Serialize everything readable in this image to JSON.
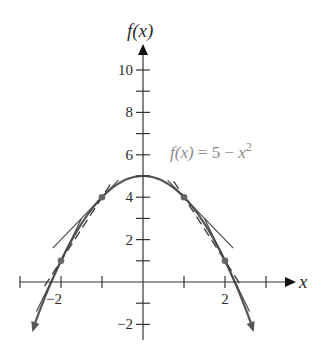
{
  "chart_data": {
    "type": "line",
    "title": "",
    "function_label": "f(x) = 5 − x²",
    "function_label_parts": {
      "lhs": "f(x)",
      "eq": " = 5 − ",
      "var": "x",
      "exp": "2"
    },
    "xlabel": "x",
    "ylabel": "f(x)",
    "xlim": [
      -3.4,
      3.6
    ],
    "ylim": [
      -2.8,
      11.4
    ],
    "grid": false,
    "x_ticks": [
      -3,
      -2,
      -1,
      0,
      1,
      2,
      3
    ],
    "x_tick_labels": [
      {
        "value": -2,
        "label": "−2"
      },
      {
        "value": 2,
        "label": "2"
      }
    ],
    "y_ticks": [
      -2,
      -1,
      1,
      2,
      3,
      4,
      5,
      6,
      7,
      8,
      9,
      10
    ],
    "y_tick_labels": [
      {
        "value": 10,
        "label": "10"
      },
      {
        "value": 8,
        "label": "8"
      },
      {
        "value": 6,
        "label": "6"
      },
      {
        "value": 4,
        "label": "4"
      },
      {
        "value": 2,
        "label": "2"
      },
      {
        "value": -2,
        "label": "−2"
      }
    ],
    "series": [
      {
        "name": "f(x) = 5 − x²",
        "style": "solid-curve",
        "x": [
          -2.65,
          -2.5,
          -2,
          -1.5,
          -1,
          -0.5,
          0,
          0.5,
          1,
          1.5,
          2,
          2.5,
          2.65
        ],
        "y": [
          -2.02,
          -1.25,
          1,
          2.75,
          4,
          4.75,
          5,
          4.75,
          4,
          2.75,
          1,
          -1.25,
          -2.02
        ]
      },
      {
        "name": "tangent at x=1",
        "style": "solid",
        "equation": "y = 6 − 2x",
        "x": [
          0.6,
          2.2
        ],
        "y": [
          4.8,
          1.6
        ]
      },
      {
        "name": "tangent at x=-1",
        "style": "solid",
        "equation": "y = 6 + 2x",
        "x": [
          -2.2,
          -0.6
        ],
        "y": [
          1.6,
          4.8
        ]
      },
      {
        "name": "secant x=1 to x=2",
        "style": "dashed",
        "equation": "y = 7 − 3x",
        "x": [
          0.75,
          2.4
        ],
        "y": [
          4.75,
          -0.2
        ]
      },
      {
        "name": "secant x=-2 to x=-1",
        "style": "dashed",
        "equation": "y = 7 + 3x",
        "x": [
          -2.4,
          -0.75
        ],
        "y": [
          -0.2,
          4.75
        ]
      },
      {
        "name": "tangent at x=2",
        "style": "solid",
        "equation": "y = 9 − 4x",
        "x": [
          1.5,
          2.6
        ],
        "y": [
          3,
          -1.4
        ]
      },
      {
        "name": "tangent at x=-2",
        "style": "solid",
        "equation": "y = 9 + 4x",
        "x": [
          -2.6,
          -1.5
        ],
        "y": [
          -1.4,
          3
        ]
      }
    ],
    "points": [
      {
        "x": -2,
        "y": 1
      },
      {
        "x": -1,
        "y": 4
      },
      {
        "x": 1,
        "y": 4
      },
      {
        "x": 2,
        "y": 1
      }
    ],
    "legend": "none"
  }
}
